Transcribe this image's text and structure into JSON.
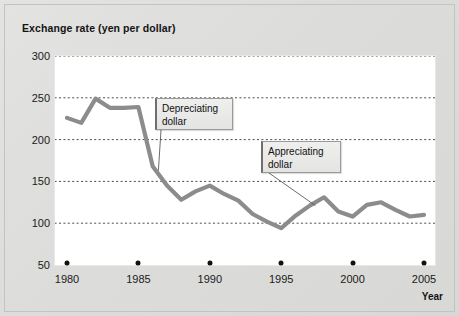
{
  "chart_data": {
    "type": "line",
    "title": "Exchange rate (yen per dollar)",
    "xlabel": "Year",
    "ylabel": "Exchange rate (yen per dollar)",
    "xlim": [
      1980,
      2005
    ],
    "ylim": [
      50,
      300
    ],
    "grid": true,
    "legend": "none",
    "ytick_labels": [
      "300",
      "250",
      "200",
      "150",
      "100",
      "50"
    ],
    "yticks": [
      300,
      250,
      200,
      150,
      100,
      50
    ],
    "xtick_labels": [
      "1980",
      "1985",
      "1990",
      "1995",
      "2000",
      "2005"
    ],
    "xticks": [
      1980,
      1985,
      1990,
      1995,
      2000,
      2005
    ],
    "x": [
      1980,
      1981,
      1982,
      1983,
      1984,
      1985,
      1986,
      1987,
      1988,
      1989,
      1990,
      1991,
      1992,
      1993,
      1994,
      1995,
      1996,
      1997,
      1998,
      1999,
      2000,
      2001,
      2002,
      2003,
      2004,
      2005
    ],
    "values": [
      226,
      220,
      249,
      238,
      238,
      239,
      168,
      145,
      128,
      138,
      145,
      135,
      127,
      111,
      102,
      94,
      109,
      121,
      131,
      114,
      108,
      122,
      125,
      116,
      108,
      110
    ],
    "series": [
      {
        "name": "Yen per dollar",
        "color": "#8c8c8c",
        "values": [
          226,
          220,
          249,
          238,
          238,
          239,
          168,
          145,
          128,
          138,
          145,
          135,
          127,
          111,
          102,
          94,
          109,
          121,
          131,
          114,
          108,
          122,
          125,
          116,
          108,
          110
        ]
      }
    ],
    "annotations": [
      {
        "text": "Depreciating dollar",
        "line1": "Depreciating",
        "line2": "dollar",
        "target_x": 1986.4,
        "target_y": 163
      },
      {
        "text": "Appreciating dollar",
        "line1": "Appreciating",
        "line2": "dollar",
        "target_x": 1997.4,
        "target_y": 121
      }
    ]
  },
  "axis": {
    "year_label": "Year"
  }
}
